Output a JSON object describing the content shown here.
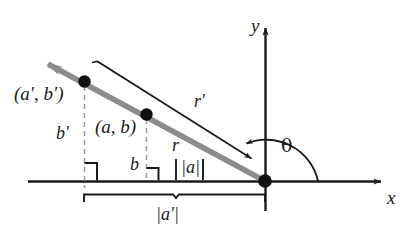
{
  "figure": {
    "type": "geometry-diagram",
    "background_color": "#ffffff",
    "ink_color": "#1a1a1a",
    "ray_color": "#8c8c8c",
    "dash_color": "#999999",
    "axes": {
      "x_label": "x",
      "y_label": "y",
      "origin_label": "",
      "x_axis_from": [
        28,
        181
      ],
      "x_axis_to": [
        388,
        181
      ],
      "y_axis_from": [
        265,
        210
      ],
      "y_axis_to": [
        265,
        22
      ]
    },
    "angle": {
      "label": "θ",
      "description": "angle measured counterclockwise from positive x-axis to the ray"
    },
    "points": [
      {
        "id": "outer",
        "label": "(a′, b′)",
        "x": 83,
        "y": 82
      },
      {
        "id": "inner",
        "label": "(a, b)",
        "x": 145,
        "y": 115
      },
      {
        "id": "origin",
        "label": "",
        "x": 265,
        "y": 181
      }
    ],
    "segments": [
      {
        "id": "r-prime",
        "label": "r′",
        "description": "distance from origin to (a′, b′)"
      },
      {
        "id": "r",
        "label": "r",
        "description": "distance from origin to (a, b)"
      },
      {
        "id": "b-prime",
        "label": "b′",
        "description": "vertical leg of outer point"
      },
      {
        "id": "b",
        "label": "b",
        "description": "vertical leg of inner point"
      },
      {
        "id": "abs-a",
        "label": "|a|",
        "description": "horizontal leg of inner point"
      },
      {
        "id": "abs-a-prime",
        "label": "|a′|",
        "description": "horizontal leg of outer point"
      }
    ],
    "markers": {
      "right_angle_outer": true,
      "right_angle_inner": true,
      "brace_bottom": true
    }
  }
}
